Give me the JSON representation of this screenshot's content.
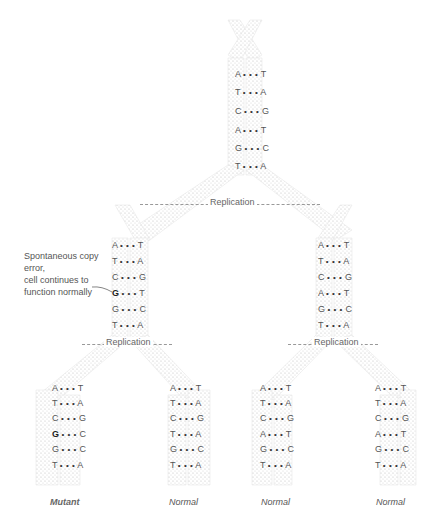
{
  "diagram": {
    "title": "",
    "replication_label": "Replication",
    "annotation": {
      "lines": [
        "Spontaneous copy",
        "error,",
        "cell continues to",
        "function normally"
      ]
    },
    "parent": {
      "pairs": [
        [
          "A",
          "T"
        ],
        [
          "T",
          "A"
        ],
        [
          "C",
          "G"
        ],
        [
          "A",
          "T"
        ],
        [
          "G",
          "C"
        ],
        [
          "T",
          "A"
        ]
      ]
    },
    "generation1": [
      {
        "pairs": [
          [
            "A",
            "T"
          ],
          [
            "T",
            "A"
          ],
          [
            "C",
            "G"
          ],
          [
            "G",
            "T"
          ],
          [
            "G",
            "C"
          ],
          [
            "T",
            "A"
          ]
        ],
        "error_row": 3
      },
      {
        "pairs": [
          [
            "A",
            "T"
          ],
          [
            "T",
            "A"
          ],
          [
            "C",
            "G"
          ],
          [
            "A",
            "T"
          ],
          [
            "G",
            "C"
          ],
          [
            "T",
            "A"
          ]
        ]
      }
    ],
    "generation2": [
      {
        "pairs": [
          [
            "A",
            "T"
          ],
          [
            "T",
            "A"
          ],
          [
            "C",
            "G"
          ],
          [
            "G",
            "C"
          ],
          [
            "G",
            "C"
          ],
          [
            "T",
            "A"
          ]
        ],
        "label": "Mutant",
        "mutant_row": 3
      },
      {
        "pairs": [
          [
            "A",
            "T"
          ],
          [
            "T",
            "A"
          ],
          [
            "C",
            "G"
          ],
          [
            "T",
            "A"
          ],
          [
            "G",
            "C"
          ],
          [
            "T",
            "A"
          ]
        ],
        "label": "Normal"
      },
      {
        "pairs": [
          [
            "A",
            "T"
          ],
          [
            "T",
            "A"
          ],
          [
            "C",
            "G"
          ],
          [
            "A",
            "T"
          ],
          [
            "G",
            "C"
          ],
          [
            "T",
            "A"
          ]
        ],
        "label": "Normal"
      },
      {
        "pairs": [
          [
            "A",
            "T"
          ],
          [
            "T",
            "A"
          ],
          [
            "C",
            "G"
          ],
          [
            "A",
            "T"
          ],
          [
            "G",
            "C"
          ],
          [
            "T",
            "A"
          ]
        ],
        "label": "Normal"
      }
    ],
    "dots": "• • •",
    "colors": {
      "strand_stipple": "#bdbdbd",
      "text": "#555555",
      "dash": "#999999",
      "background": "#ffffff"
    }
  }
}
